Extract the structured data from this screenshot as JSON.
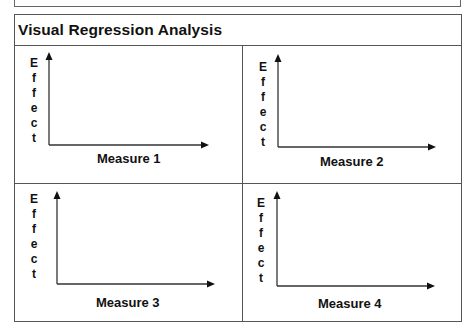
{
  "title": "Visual Regression Analysis",
  "panels": [
    {
      "id": 1,
      "y_label": "Effect",
      "y_letters": [
        "E",
        "f",
        "f",
        "e",
        "c",
        "t"
      ],
      "x_label": "Measure 1"
    },
    {
      "id": 2,
      "y_label": "Effect",
      "y_letters": [
        "E",
        "f",
        "f",
        "e",
        "c",
        "t"
      ],
      "x_label": "Measure 2"
    },
    {
      "id": 3,
      "y_label": "Effect",
      "y_letters": [
        "E",
        "f",
        "f",
        "e",
        "c",
        "t"
      ],
      "x_label": "Measure 3"
    },
    {
      "id": 4,
      "y_label": "Effect",
      "y_letters": [
        "E",
        "f",
        "f",
        "e",
        "c",
        "t"
      ],
      "x_label": "Measure 4"
    }
  ],
  "colors": {
    "line": "#555555",
    "axis": "#333333",
    "text": "#111111",
    "background": "#ffffff"
  }
}
